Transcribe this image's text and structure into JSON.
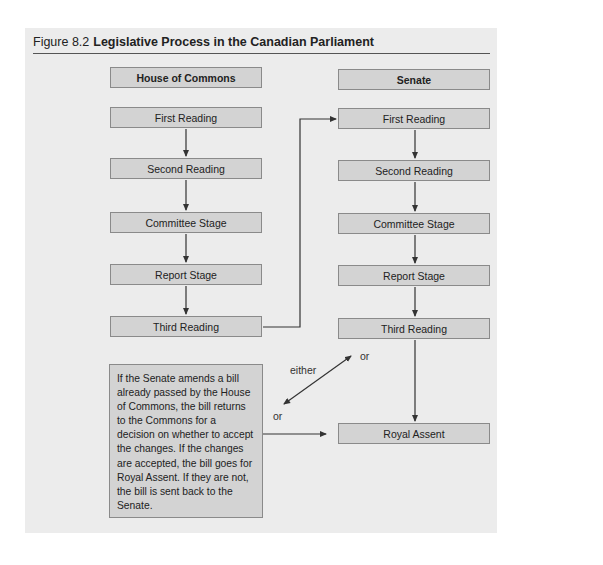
{
  "figure": {
    "number": "Figure 8.2",
    "title": "Legislative Process in the Canadian Parliament"
  },
  "house_of_commons": {
    "header": "House of Commons",
    "stages": [
      "First Reading",
      "Second Reading",
      "Committee Stage",
      "Report Stage",
      "Third Reading"
    ]
  },
  "senate": {
    "header": "Senate",
    "stages": [
      "First Reading",
      "Second Reading",
      "Committee Stage",
      "Report Stage",
      "Third Reading"
    ]
  },
  "final_stage": "Royal Assent",
  "note": "If the Senate amends a bill already passed by the House of Commons, the bill returns to the Commons for a decision on whether to accept the changes. If the changes are accepted, the bill goes for Royal Assent. If they are not, the bill is sent back to the Senate.",
  "labels": {
    "either": "either",
    "or_top": "or",
    "or_bottom": "or"
  },
  "colors": {
    "panel_bg": "#ececec",
    "box_fill": "#d3d3d3",
    "box_border": "#8a8a8a",
    "line": "#333333"
  }
}
